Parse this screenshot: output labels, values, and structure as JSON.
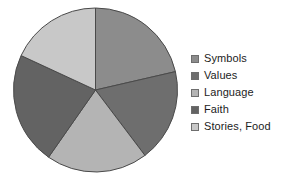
{
  "chart_data": {
    "type": "pie",
    "title": "",
    "categories": [
      "Symbols",
      "Values",
      "Language",
      "Faith",
      "Stories, Food"
    ],
    "values": [
      21.4,
      18.3,
      20.0,
      22.2,
      18.1
    ],
    "colors": [
      "#8c8c8c",
      "#6e6e6e",
      "#b4b4b4",
      "#636363",
      "#c8c8c8"
    ],
    "start_angle_deg": 0,
    "direction": "clockwise",
    "legend_position": "right",
    "grid": false,
    "labels_shown": false,
    "slice_border_color": "#4a4a4a",
    "background": "#ffffff"
  },
  "legend": {
    "items": [
      {
        "label": "Symbols",
        "color": "#8c8c8c"
      },
      {
        "label": "Values",
        "color": "#6e6e6e"
      },
      {
        "label": "Language",
        "color": "#b4b4b4"
      },
      {
        "label": "Faith",
        "color": "#636363"
      },
      {
        "label": "Stories, Food",
        "color": "#c8c8c8"
      }
    ]
  },
  "geometry": {
    "center_x": 95.5,
    "center_y": 90,
    "radius": 82
  }
}
